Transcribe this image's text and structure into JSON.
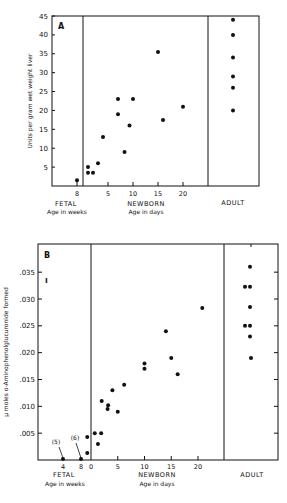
{
  "chart_data": [
    {
      "type": "scatter",
      "panel": "A",
      "title": "",
      "ylabel": "Units per gram wet weight liver",
      "ylim": [
        0,
        45
      ],
      "yticks": [
        5,
        10,
        15,
        20,
        25,
        30,
        35,
        40,
        45
      ],
      "groups": [
        {
          "name": "FETAL",
          "xlabel": "Age in weeks",
          "xticks": [
            8
          ],
          "points": [
            {
              "x": 8,
              "y": 1.5
            }
          ]
        },
        {
          "name": "NEWBORN",
          "xlabel": "Age in days",
          "xticks": [
            5,
            10,
            15,
            20
          ],
          "points": [
            {
              "x": 1,
              "y": 5
            },
            {
              "x": 1,
              "y": 3.5
            },
            {
              "x": 2,
              "y": 3.5
            },
            {
              "x": 3,
              "y": 6
            },
            {
              "x": 4,
              "y": 13
            },
            {
              "x": 7,
              "y": 23
            },
            {
              "x": 7,
              "y": 19
            },
            {
              "x": 8.3,
              "y": 9
            },
            {
              "x": 9.3,
              "y": 16
            },
            {
              "x": 10,
              "y": 23
            },
            {
              "x": 15,
              "y": 35.5
            },
            {
              "x": 16,
              "y": 17.5
            },
            {
              "x": 20,
              "y": 21
            }
          ]
        },
        {
          "name": "ADULT",
          "xlabel": "",
          "xticks": [],
          "points": [
            {
              "x": 0,
              "y": 44
            },
            {
              "x": 0,
              "y": 40
            },
            {
              "x": 0,
              "y": 34
            },
            {
              "x": 0,
              "y": 29
            },
            {
              "x": 0,
              "y": 26
            },
            {
              "x": 0,
              "y": 20
            }
          ]
        }
      ]
    },
    {
      "type": "scatter",
      "panel": "B",
      "title": "",
      "ylabel": "µ moles o-Aminophenolglucuronide formed",
      "ylim": [
        0,
        0.04
      ],
      "yticks": [
        ".005",
        ".010",
        ".015",
        ".020",
        ".025",
        ".030",
        ".035"
      ],
      "groups": [
        {
          "name": "FETAL",
          "xlabel": "Age in weeks",
          "xticks": [
            4,
            8
          ],
          "annotations": [
            {
              "text": "(5)",
              "x": 4,
              "y": 0
            },
            {
              "text": "(6)",
              "x": 8,
              "y": 0
            }
          ],
          "points": [
            {
              "x": 4,
              "y": 0
            },
            {
              "x": 8,
              "y": 0
            }
          ]
        },
        {
          "name": "NEWBORN",
          "xlabel": "Age in days",
          "xticks": [
            0,
            5,
            10,
            15,
            20
          ],
          "points": [
            {
              "x": -0.7,
              "y": 0.0043
            },
            {
              "x": -0.7,
              "y": 0.0013
            },
            {
              "x": 0.7,
              "y": 0.005
            },
            {
              "x": 1.9,
              "y": 0.005
            },
            {
              "x": 1.3,
              "y": 0.003
            },
            {
              "x": 2,
              "y": 0.011
            },
            {
              "x": 3.2,
              "y": 0.0102
            },
            {
              "x": 3.1,
              "y": 0.0095
            },
            {
              "x": 4,
              "y": 0.013
            },
            {
              "x": 5,
              "y": 0.009
            },
            {
              "x": 6.2,
              "y": 0.014
            },
            {
              "x": 10,
              "y": 0.018
            },
            {
              "x": 10,
              "y": 0.017
            },
            {
              "x": 14,
              "y": 0.024
            },
            {
              "x": 15,
              "y": 0.019
            },
            {
              "x": 16.2,
              "y": 0.016
            },
            {
              "x": 20.8,
              "y": 0.0283
            }
          ]
        },
        {
          "name": "ADULT",
          "xlabel": "",
          "xticks": [],
          "points": [
            {
              "x": 0,
              "y": 0.036
            },
            {
              "x": -1,
              "y": 0.0323
            },
            {
              "x": 0,
              "y": 0.0323
            },
            {
              "x": 0,
              "y": 0.0285
            },
            {
              "x": -1,
              "y": 0.025
            },
            {
              "x": 0,
              "y": 0.025
            },
            {
              "x": 0,
              "y": 0.023
            },
            {
              "x": 0.2,
              "y": 0.019
            }
          ]
        }
      ]
    }
  ],
  "labels": {
    "a": {
      "panel": "A",
      "fetal": "FETAL",
      "fetal_sub": "Age in weeks",
      "newborn": "NEWBORN",
      "newborn_sub": "Age in days",
      "adult": "ADULT",
      "ylabel": "Units per gram wet weight liver"
    },
    "b": {
      "panel": "B",
      "fetal": "FETAL",
      "fetal_sub": "Age in weeks",
      "newborn": "NEWBORN",
      "newborn_sub": "Age in days",
      "adult": "ADULT",
      "ylabel": "µ moles o-Aminophenolglucuronide formed",
      "ann5": "(5)",
      "ann6": "(6)"
    }
  }
}
